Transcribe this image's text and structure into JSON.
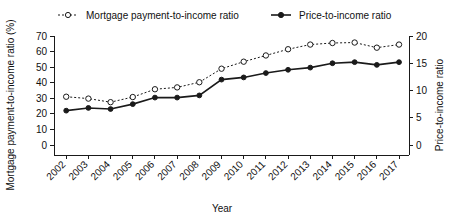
{
  "chart_data": {
    "type": "line",
    "title": "",
    "xlabel": "Year",
    "ylabel": "Mortgage payment-to-income ratio (%)",
    "y2label": "Price-to-income ratio",
    "grid": false,
    "legend_position": "top",
    "categories": [
      "2002",
      "2003",
      "2004",
      "2005",
      "2006",
      "2007",
      "2008",
      "2009",
      "2010",
      "2011",
      "2012",
      "2013",
      "2014",
      "2015",
      "2016",
      "2017"
    ],
    "x": [
      2002,
      2003,
      2004,
      2005,
      2006,
      2007,
      2008,
      2009,
      2010,
      2011,
      2012,
      2013,
      2014,
      2015,
      2016,
      2017
    ],
    "ylim": [
      0,
      70
    ],
    "yticks": [
      0,
      10,
      20,
      30,
      40,
      50,
      60,
      70
    ],
    "y2lim": [
      0,
      20
    ],
    "y2ticks": [
      0,
      5,
      10,
      15,
      20
    ],
    "series": [
      {
        "name": "Mortgage payment-to-income ratio",
        "axis": "left",
        "marker": "open-circle",
        "line_style": "dotted",
        "values": [
          31.0,
          29.8,
          27.5,
          30.8,
          35.8,
          37.0,
          40.3,
          49.0,
          53.5,
          57.5,
          61.5,
          64.5,
          65.5,
          65.8,
          62.5,
          64.5
        ]
      },
      {
        "name": "Price-to-income ratio",
        "axis": "right",
        "marker": "filled-circle",
        "line_style": "solid",
        "values": [
          6.3,
          6.8,
          6.6,
          7.5,
          8.7,
          8.7,
          9.1,
          12.0,
          12.4,
          13.2,
          13.8,
          14.2,
          15.0,
          15.2,
          14.7,
          15.2
        ]
      }
    ],
    "legend": [
      {
        "label": "Mortgage payment-to-income ratio",
        "marker": "open-circle",
        "line_style": "dotted"
      },
      {
        "label": "Price-to-income ratio",
        "marker": "filled-circle",
        "line_style": "solid"
      }
    ]
  },
  "axes": {
    "left_title": "Mortgage payment-to-income ratio (%)",
    "right_title": "Price-to-income ratio",
    "x_title": "Year",
    "left_ticks": [
      "0",
      "10",
      "20",
      "30",
      "40",
      "50",
      "60",
      "70"
    ],
    "right_ticks": [
      "0",
      "5",
      "10",
      "15",
      "20"
    ],
    "x_ticks": [
      "2002",
      "2003",
      "2004",
      "2005",
      "2006",
      "2007",
      "2008",
      "2009",
      "2010",
      "2011",
      "2012",
      "2013",
      "2014",
      "2015",
      "2016",
      "2017"
    ]
  },
  "legend": {
    "item1_label": "Mortgage payment-to-income ratio",
    "item2_label": "Price-to-income ratio"
  },
  "colors": {
    "ink": "#1a1a1a",
    "background": "#ffffff"
  }
}
